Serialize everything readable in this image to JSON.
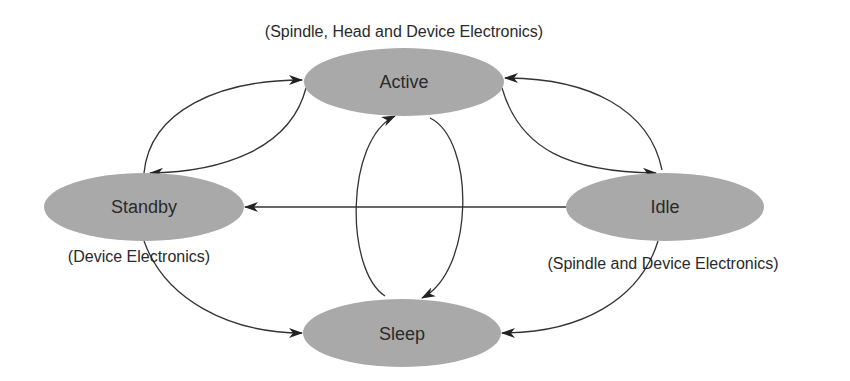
{
  "diagram": {
    "type": "state-transition",
    "colors": {
      "node_fill": "#a9a9a9",
      "edge": "#333333",
      "text": "#2a2a2a",
      "background": "#ffffff"
    },
    "nodes": [
      {
        "id": "active",
        "label": "Active",
        "note": "(Spindle, Head and Device Electronics)"
      },
      {
        "id": "standby",
        "label": "Standby",
        "note": "(Device Electronics)"
      },
      {
        "id": "idle",
        "label": "Idle",
        "note": "(Spindle and Device Electronics)"
      },
      {
        "id": "sleep",
        "label": "Sleep",
        "note": ""
      }
    ],
    "edges": [
      {
        "from": "standby",
        "to": "active"
      },
      {
        "from": "active",
        "to": "standby"
      },
      {
        "from": "idle",
        "to": "active"
      },
      {
        "from": "active",
        "to": "idle"
      },
      {
        "from": "idle",
        "to": "standby"
      },
      {
        "from": "sleep",
        "to": "active"
      },
      {
        "from": "active",
        "to": "sleep"
      },
      {
        "from": "standby",
        "to": "sleep"
      },
      {
        "from": "idle",
        "to": "sleep"
      }
    ]
  }
}
